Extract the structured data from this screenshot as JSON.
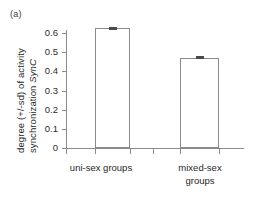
{
  "panel": {
    "label": "(a)"
  },
  "chart_data": {
    "type": "bar",
    "title": "",
    "panel_label": "(a)",
    "xlabel": "",
    "ylabel": "degree (+/-sd) of activity synchronization SynC",
    "ylabel_lines": [
      "degree (+/-sd) of activity",
      "synchronization "
    ],
    "ylabel_italic_part": "SynC",
    "categories": [
      "uni-sex groups",
      "mixed-sex groups"
    ],
    "category_label_lines": [
      [
        "uni-sex groups"
      ],
      [
        "mixed-sex",
        "groups"
      ]
    ],
    "values": [
      0.625,
      0.47
    ],
    "errors": [
      0.008,
      0.008
    ],
    "ylim": [
      0,
      0.65
    ],
    "yticks": [
      0,
      0.1,
      0.2,
      0.3,
      0.4,
      0.5,
      0.6
    ],
    "ytick_labels": [
      "0",
      "0.1",
      "0.2",
      "0.3",
      "0.4",
      "0.5",
      "0.6"
    ],
    "grid": false,
    "legend": false,
    "legend_position": "none",
    "bar_fill_color": "#ffffff",
    "bar_edge_color": "#8a8a8a",
    "error_bar_color": "#4a4a4a",
    "axis_color": "#8a8a8a"
  }
}
